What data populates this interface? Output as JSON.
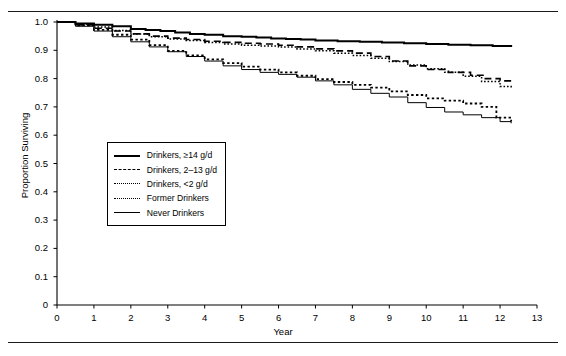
{
  "figure": {
    "top_fragment": "",
    "y_axis_title": "Proportion Surviving",
    "x_axis_title": "Year"
  },
  "legend": {
    "items": [
      {
        "label": "Drinkers, ≥14 g/d",
        "style": "solid-thick"
      },
      {
        "label": "Drinkers, 2–13 g/d",
        "style": "dashed"
      },
      {
        "label": "Drinkers, <2 g/d",
        "style": "dotted-fine"
      },
      {
        "label": "Former Drinkers",
        "style": "dotted-coarse"
      },
      {
        "label": "Never Drinkers",
        "style": "solid-thin"
      }
    ]
  },
  "chart_data": {
    "type": "line",
    "title": "",
    "subtitle": "",
    "xlabel": "Year",
    "ylabel": "Proportion Surviving",
    "xlim": [
      0,
      13
    ],
    "ylim": [
      0,
      1.0
    ],
    "xticks": [
      0,
      1,
      2,
      3,
      4,
      5,
      6,
      7,
      8,
      9,
      10,
      11,
      12,
      13
    ],
    "yticks": [
      0,
      0.1,
      0.2,
      0.3,
      0.4,
      0.5,
      0.6,
      0.7,
      0.8,
      0.9,
      1.0
    ],
    "ytick_labels": [
      "0",
      "0.1",
      "0.2",
      "0.3",
      "0.4",
      "0.5",
      "0.6",
      "0.7",
      "0.8",
      "0.9",
      "1.0"
    ],
    "xtick_labels": [
      "0",
      "1",
      "2",
      "3",
      "4",
      "5",
      "6",
      "7",
      "8",
      "9",
      "10",
      "11",
      "12",
      "13"
    ],
    "grid": false,
    "legend_position": "center-left",
    "step": true,
    "series": [
      {
        "name": "Drinkers, ≥14 g/d",
        "style": "solid-thick",
        "x": [
          0,
          0.5,
          1.0,
          1.5,
          2.0,
          2.4,
          2.8,
          3.2,
          3.6,
          4.0,
          4.5,
          5.0,
          5.4,
          5.8,
          6.2,
          6.6,
          7.0,
          7.6,
          8.2,
          8.8,
          9.4,
          10.0,
          10.6,
          11.2,
          11.8,
          12.3
        ],
        "y": [
          1.0,
          0.995,
          0.99,
          0.985,
          0.975,
          0.972,
          0.968,
          0.963,
          0.958,
          0.955,
          0.95,
          0.948,
          0.945,
          0.942,
          0.94,
          0.938,
          0.935,
          0.932,
          0.93,
          0.928,
          0.925,
          0.922,
          0.92,
          0.918,
          0.915,
          0.912
        ]
      },
      {
        "name": "Drinkers, 2–13 g/d",
        "style": "dashed",
        "x": [
          0,
          0.5,
          1.0,
          1.5,
          2.0,
          2.5,
          3.0,
          3.5,
          4.0,
          4.5,
          5.0,
          5.5,
          6.0,
          6.5,
          7.0,
          7.5,
          8.0,
          8.5,
          9.0,
          9.5,
          10.0,
          10.6,
          11.2,
          11.6,
          12.0,
          12.3
        ],
        "y": [
          1.0,
          0.99,
          0.978,
          0.968,
          0.958,
          0.95,
          0.943,
          0.938,
          0.932,
          0.928,
          0.925,
          0.922,
          0.918,
          0.912,
          0.905,
          0.898,
          0.89,
          0.878,
          0.862,
          0.845,
          0.832,
          0.822,
          0.812,
          0.8,
          0.792,
          0.79
        ]
      },
      {
        "name": "Drinkers, <2 g/d",
        "style": "dotted-fine",
        "x": [
          0,
          0.5,
          1.0,
          1.5,
          2.0,
          2.5,
          3.0,
          3.5,
          4.0,
          4.5,
          5.0,
          5.5,
          6.0,
          6.5,
          7.0,
          7.5,
          8.0,
          8.5,
          9.0,
          9.5,
          10.0,
          10.5,
          11.0,
          11.5,
          12.0,
          12.3
        ],
        "y": [
          1.0,
          0.992,
          0.982,
          0.97,
          0.958,
          0.948,
          0.94,
          0.935,
          0.928,
          0.922,
          0.918,
          0.915,
          0.912,
          0.905,
          0.898,
          0.89,
          0.882,
          0.872,
          0.86,
          0.848,
          0.835,
          0.822,
          0.808,
          0.79,
          0.772,
          0.762
        ]
      },
      {
        "name": "Former Drinkers",
        "style": "dotted-coarse",
        "x": [
          0,
          0.5,
          1.0,
          1.5,
          2.0,
          2.5,
          3.0,
          3.5,
          4.0,
          4.5,
          5.0,
          5.5,
          6.0,
          6.5,
          7.0,
          7.5,
          8.0,
          8.5,
          9.0,
          9.5,
          10.0,
          10.5,
          11.0,
          11.5,
          11.9,
          12.3
        ],
        "y": [
          1.0,
          0.988,
          0.972,
          0.955,
          0.938,
          0.918,
          0.898,
          0.882,
          0.868,
          0.855,
          0.842,
          0.832,
          0.822,
          0.81,
          0.798,
          0.788,
          0.778,
          0.768,
          0.755,
          0.742,
          0.73,
          0.722,
          0.712,
          0.7,
          0.662,
          0.648
        ]
      },
      {
        "name": "Never Drinkers",
        "style": "solid-thin",
        "x": [
          0,
          0.5,
          1.0,
          1.5,
          2.0,
          2.5,
          3.0,
          3.5,
          4.0,
          4.5,
          5.0,
          5.5,
          6.0,
          6.5,
          7.0,
          7.5,
          8.0,
          8.5,
          9.0,
          9.5,
          10.0,
          10.5,
          11.0,
          11.5,
          12.0,
          12.3
        ],
        "y": [
          1.0,
          0.985,
          0.968,
          0.948,
          0.93,
          0.912,
          0.895,
          0.878,
          0.862,
          0.845,
          0.832,
          0.822,
          0.815,
          0.805,
          0.792,
          0.778,
          0.762,
          0.748,
          0.735,
          0.715,
          0.698,
          0.682,
          0.672,
          0.662,
          0.648,
          0.642
        ]
      }
    ]
  }
}
